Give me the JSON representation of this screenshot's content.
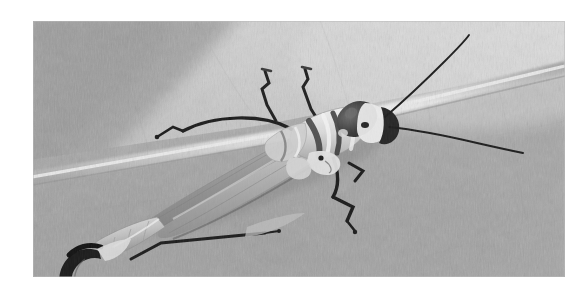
{
  "image": {
    "kind": "macro-photograph",
    "subject": "winged insect (stonefly / grasshopper-like) resting on a leaf",
    "rendering": "grayscale / black and white",
    "alt_text": "Black and white macro photograph of a slender winged insect with long antennae resting on a large pale leaf, a bright leaf vein crossing diagonally behind it",
    "caption": "",
    "frame": {
      "mat_color": "#ffffff",
      "photo_left": 33,
      "photo_top": 21,
      "photo_width": 532,
      "photo_height": 256
    },
    "palette": {
      "leaf_light": "#d2d2d2",
      "leaf_mid": "#b6b6b6",
      "leaf_base": "#a8a8a8",
      "leaf_shadow": "#989898",
      "leaf_dark": "#8c8c8c",
      "vein_highlight": "#e6e6e6",
      "vein_edge": "#9c9c9c",
      "body_light": "#e2e2e2",
      "body_mid": "#bdbdbd",
      "body_dark": "#3a3a3a",
      "ink_black": "#1b1b1b",
      "wing_grey": "#9a9a9a"
    },
    "regions": [
      {
        "name": "leaf-upper-left-shadow",
        "tone": "#9a9a9a",
        "note": "broad dark diagonal band across the upper left corner"
      },
      {
        "name": "leaf-upper-right-highlight",
        "tone": "#dcdcdc",
        "note": "bright pale leaf area top right"
      },
      {
        "name": "leaf-lower-field",
        "tone": "#ababab",
        "note": "mid grey textured leaf surface filling the lower two thirds"
      },
      {
        "name": "leaf-main-vein",
        "tone": "#e8e8e8",
        "note": "bright vein running from upper right down to the left edge"
      }
    ],
    "subject_parts": [
      {
        "name": "head",
        "note": "rounded dark capsule with pale band at the right end of the body"
      },
      {
        "name": "pronotum",
        "note": "pale banded segment behind the head"
      },
      {
        "name": "antenna-upper",
        "note": "long thin dark antenna sweeping up and to the right"
      },
      {
        "name": "antenna-lower",
        "note": "long thin dark antenna sweeping right and slightly down"
      },
      {
        "name": "forewings",
        "note": "long folded translucent grey wings angled down to the left"
      },
      {
        "name": "abdomen",
        "note": "pale segmented abdomen at the lower left"
      },
      {
        "name": "cercus-pincer",
        "note": "dark curved pincer-like appendage at the far lower left"
      },
      {
        "name": "foreleg-left",
        "note": "thin dark leg arcing up and left from the thorax"
      },
      {
        "name": "midleg-right",
        "note": "dark bent leg descending to the lower right"
      },
      {
        "name": "hindleg-lower",
        "note": "thin dark leg extending right below the abdomen"
      },
      {
        "name": "palp-pair",
        "note": "two short dark hooked appendages raised above the thorax"
      }
    ]
  }
}
